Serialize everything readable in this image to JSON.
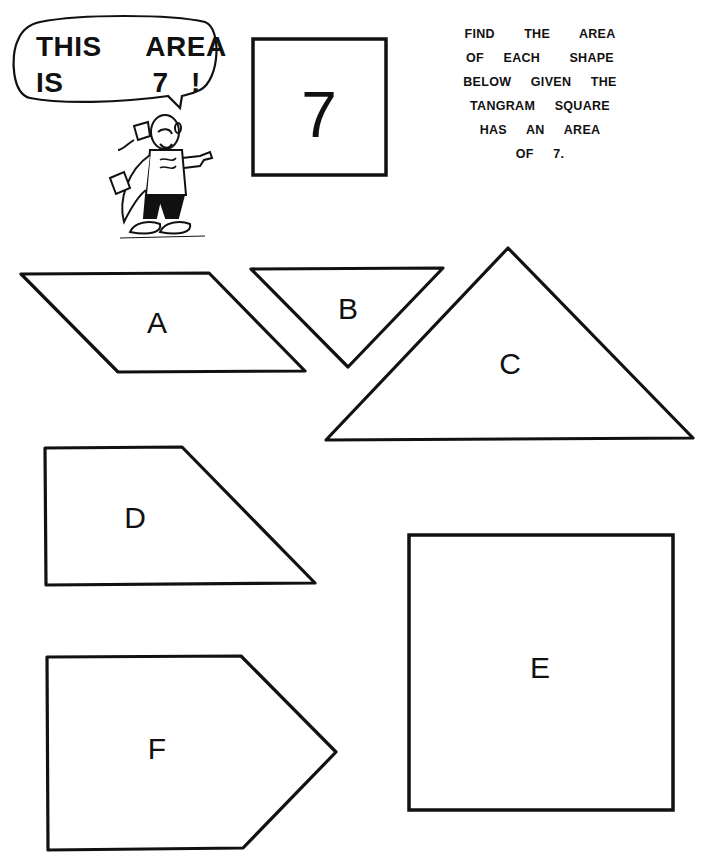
{
  "speech_bubble": {
    "lines": [
      "THIS  AREA",
      "IS    7 !"
    ]
  },
  "tangram_square": {
    "label": "7",
    "area": 7
  },
  "instructions": {
    "lines": [
      "FIND   THE   AREA",
      "OF  EACH   SHAPE",
      "BELOW  GIVEN  THE",
      "TANGRAM  SQUARE",
      "HAS  AN  AREA",
      "OF  7."
    ]
  },
  "mascot": {
    "icon": "pointing-cartoon-character-icon"
  },
  "shapes": [
    {
      "id": "A",
      "label": "A",
      "kind": "parallelogram"
    },
    {
      "id": "B",
      "label": "B",
      "kind": "inverted-right-triangle"
    },
    {
      "id": "C",
      "label": "C",
      "kind": "right-isosceles-triangle"
    },
    {
      "id": "D",
      "label": "D",
      "kind": "trapezoid"
    },
    {
      "id": "E",
      "label": "E",
      "kind": "square"
    },
    {
      "id": "F",
      "label": "F",
      "kind": "pentagon"
    }
  ],
  "colors": {
    "ink": "#111111",
    "paper": "#ffffff"
  }
}
